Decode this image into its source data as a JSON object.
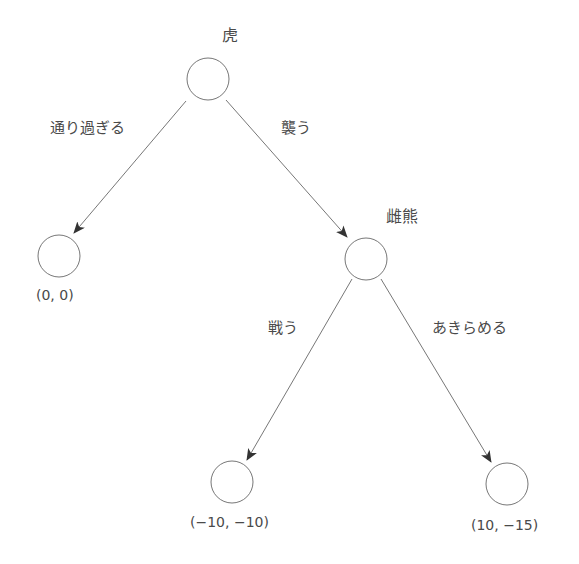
{
  "diagram": {
    "type": "game-tree",
    "nodes": [
      {
        "id": "root",
        "player": "虎",
        "cx": 208,
        "cy": 79
      },
      {
        "id": "bear",
        "player": "雌熊",
        "cx": 366,
        "cy": 259
      },
      {
        "id": "leaf_pass",
        "payoff": "(0, 0)",
        "cx": 59,
        "cy": 256
      },
      {
        "id": "leaf_fight",
        "payoff": "(−10, −10)",
        "cx": 232,
        "cy": 482
      },
      {
        "id": "leaf_giveup",
        "payoff": "(10, −15)",
        "cx": 507,
        "cy": 484
      }
    ],
    "edges": [
      {
        "from": "root",
        "to": "leaf_pass",
        "label": "通り過ぎる"
      },
      {
        "from": "root",
        "to": "bear",
        "label": "襲う"
      },
      {
        "from": "bear",
        "to": "leaf_fight",
        "label": "戦う"
      },
      {
        "from": "bear",
        "to": "leaf_giveup",
        "label": "あきらめる"
      }
    ],
    "colors": {
      "stroke": "#777777",
      "text": "#4a4a4a",
      "arrow": "#333333"
    }
  }
}
